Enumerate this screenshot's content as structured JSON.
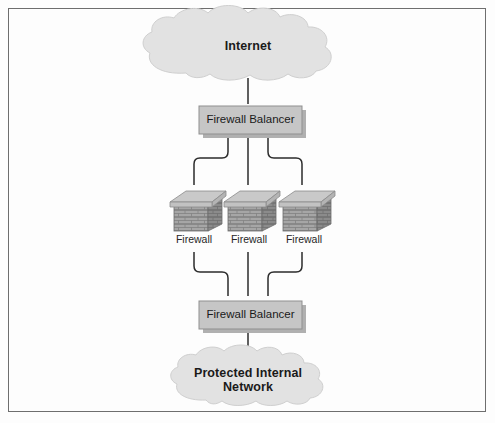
{
  "figure": {
    "type": "network-topology-diagram",
    "border_color": "#6e6e6e",
    "background_color": "#fdfdfd"
  },
  "palette": {
    "cloud_fill": "#e2e2e2",
    "cloud_stroke": "#cfcfcf",
    "box_fill": "#c6c6c6",
    "box_stroke": "#8f8f8f",
    "box_shadow": "#b0b0b0",
    "brick_cap": "#c9c9c9",
    "brick_front": "#a6a6a6",
    "brick_side": "#8b8b8b",
    "brick_mortar": "#7d7d7d",
    "connector": "#2b2b2b",
    "text": "#1a1a1a"
  },
  "nodes": {
    "internet_cloud": {
      "label": "Internet",
      "shape": "cloud"
    },
    "top_balancer": {
      "label": "Firewall Balancer",
      "shape": "box"
    },
    "firewalls": [
      {
        "label": "Firewall",
        "shape": "brick-wall"
      },
      {
        "label": "Firewall",
        "shape": "brick-wall"
      },
      {
        "label": "Firewall",
        "shape": "brick-wall"
      }
    ],
    "bottom_balancer": {
      "label": "Firewall Balancer",
      "shape": "box"
    },
    "internal_cloud": {
      "label_line1": "Protected Internal",
      "label_line2": "Network",
      "shape": "cloud"
    }
  },
  "connections": [
    {
      "from": "internet_cloud",
      "to": "top_balancer",
      "style": "double-arrow"
    },
    {
      "from": "top_balancer",
      "to": "firewall-1",
      "style": "double-arrow-elbow"
    },
    {
      "from": "top_balancer",
      "to": "firewall-2",
      "style": "double-arrow"
    },
    {
      "from": "top_balancer",
      "to": "firewall-3",
      "style": "double-arrow-elbow"
    },
    {
      "from": "firewall-1",
      "to": "bottom_balancer",
      "style": "double-arrow-elbow"
    },
    {
      "from": "firewall-2",
      "to": "bottom_balancer",
      "style": "double-arrow"
    },
    {
      "from": "firewall-3",
      "to": "bottom_balancer",
      "style": "double-arrow-elbow"
    },
    {
      "from": "bottom_balancer",
      "to": "internal_cloud",
      "style": "double-arrow"
    }
  ]
}
